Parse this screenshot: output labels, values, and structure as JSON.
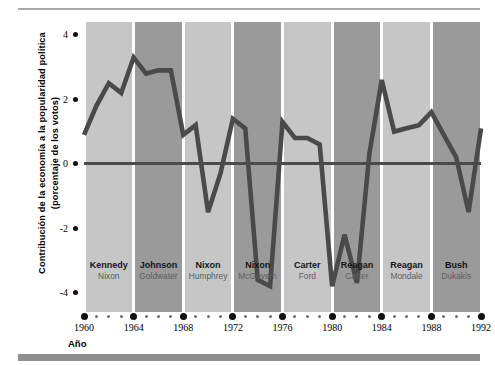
{
  "chart_data": {
    "type": "line",
    "title": "",
    "xlabel": "Año",
    "ylabel": "Contribución de la economía a la popularidad política (porcentaje de los votos)",
    "xlim": [
      1960,
      1992
    ],
    "ylim": [
      -4.6,
      4.4
    ],
    "grid": false,
    "legend_position": "none",
    "yticks": [
      4,
      2,
      0,
      -2,
      -4
    ],
    "ytick_labels": [
      "4",
      "2",
      "0",
      "-2",
      "-4"
    ],
    "xticks": [
      1960,
      1964,
      1968,
      1972,
      1976,
      1980,
      1984,
      1988,
      1992
    ],
    "xtick_labels": [
      "1960",
      "1964",
      "1968",
      "1972",
      "1976",
      "1980",
      "1984",
      "1988",
      "1992"
    ],
    "x": [
      1960,
      1961,
      1962,
      1963,
      1964,
      1965,
      1966,
      1967,
      1968,
      1969,
      1970,
      1971,
      1972,
      1973,
      1974,
      1975,
      1976,
      1977,
      1978,
      1979,
      1980,
      1981,
      1982,
      1983,
      1984,
      1985,
      1986,
      1987,
      1988,
      1989,
      1990,
      1991,
      1992
    ],
    "values": [
      0.9,
      1.8,
      2.5,
      2.2,
      3.3,
      2.8,
      2.9,
      2.9,
      0.9,
      1.2,
      -1.5,
      -0.3,
      1.4,
      1.1,
      -3.6,
      -3.8,
      1.3,
      0.8,
      0.8,
      0.6,
      -3.8,
      -2.2,
      -3.7,
      0.3,
      2.6,
      1.0,
      1.1,
      1.2,
      1.6,
      0.9,
      0.2,
      -1.5,
      1.1
    ],
    "series": [
      {
        "name": "Contribución de la economía",
        "color": "#4a4a4a",
        "values": [
          0.9,
          1.8,
          2.5,
          2.2,
          3.3,
          2.8,
          2.9,
          2.9,
          0.9,
          1.2,
          -1.5,
          -0.3,
          1.4,
          1.1,
          -3.6,
          -3.8,
          1.3,
          0.8,
          0.8,
          0.6,
          -3.8,
          -2.2,
          -3.7,
          0.3,
          2.6,
          1.0,
          1.1,
          1.2,
          1.6,
          0.9,
          0.2,
          -1.5,
          1.1
        ]
      }
    ],
    "bands": [
      {
        "start": 1960,
        "end": 1964,
        "winner": "Kennedy",
        "loser": "Nixon",
        "shade": "light"
      },
      {
        "start": 1964,
        "end": 1968,
        "winner": "Johnson",
        "loser": "Goldwater",
        "shade": "dark"
      },
      {
        "start": 1968,
        "end": 1972,
        "winner": "Nixon",
        "loser": "Humphrey",
        "shade": "light"
      },
      {
        "start": 1972,
        "end": 1976,
        "winner": "Nixon",
        "loser": "McGovern",
        "shade": "dark"
      },
      {
        "start": 1976,
        "end": 1980,
        "winner": "Carter",
        "loser": "Ford",
        "shade": "light"
      },
      {
        "start": 1980,
        "end": 1984,
        "winner": "Reagan",
        "loser": "Carter",
        "shade": "dark"
      },
      {
        "start": 1984,
        "end": 1988,
        "winner": "Reagan",
        "loser": "Mondale",
        "shade": "light"
      },
      {
        "start": 1988,
        "end": 1992,
        "winner": "Bush",
        "loser": "Dukakis",
        "shade": "dark"
      }
    ],
    "colors": {
      "line": "#4a4a4a",
      "zero_line": "#4a4a4a",
      "band_light": "#c6c6c6",
      "band_dark": "#9a9a9a",
      "rule": "#a9a9a9",
      "bottom_bar": "#8f8f8f"
    }
  }
}
